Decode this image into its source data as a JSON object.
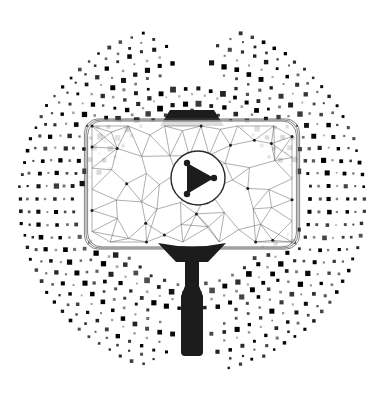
{
  "artwork": {
    "title": "Low-poly video player on selfie stick",
    "subject": "play-button-screen",
    "background_color": "#ffffff",
    "ink_color": "#222222",
    "mesh_color": "#555555",
    "dot_color": "#262626",
    "canvas": {
      "width": 384,
      "height": 398
    }
  },
  "halo": {
    "name": "dotted-rings",
    "center": {
      "x": 192,
      "y": 199
    },
    "dot_shape": "square",
    "rings": [
      {
        "radius": 172,
        "count": 88,
        "size": 3.0,
        "opacity": 0.95,
        "start_deg": 0,
        "end_deg": 360,
        "gaps": [
          [
            78,
            104
          ],
          [
            256,
            284
          ]
        ]
      },
      {
        "radius": 164,
        "count": 80,
        "size": 2.4,
        "opacity": 0.75,
        "start_deg": 0,
        "end_deg": 360,
        "gaps": [
          [
            80,
            100
          ],
          [
            258,
            282
          ]
        ]
      },
      {
        "radius": 155,
        "count": 76,
        "size": 3.6,
        "opacity": 1.0,
        "start_deg": 0,
        "end_deg": 360,
        "gaps": [
          [
            84,
            96
          ],
          [
            262,
            278
          ]
        ]
      },
      {
        "radius": 146,
        "count": 70,
        "size": 2.0,
        "opacity": 0.45,
        "start_deg": 0,
        "end_deg": 360,
        "gaps": [
          [
            82,
            98
          ],
          [
            260,
            280
          ]
        ]
      },
      {
        "radius": 137,
        "count": 66,
        "size": 4.2,
        "opacity": 1.0,
        "start_deg": 0,
        "end_deg": 360,
        "gaps": [
          [
            86,
            94
          ],
          [
            264,
            276
          ]
        ]
      },
      {
        "radius": 128,
        "count": 62,
        "size": 2.6,
        "opacity": 0.6,
        "start_deg": 0,
        "end_deg": 360,
        "gaps": [
          [
            80,
            100
          ],
          [
            258,
            282
          ]
        ]
      },
      {
        "radius": 119,
        "count": 58,
        "size": 3.4,
        "opacity": 0.9,
        "start_deg": 0,
        "end_deg": 360,
        "gaps": [
          [
            70,
            110
          ],
          [
            250,
            290
          ]
        ]
      },
      {
        "radius": 110,
        "count": 54,
        "size": 4.6,
        "opacity": 1.0,
        "start_deg": 188,
        "end_deg": 352,
        "gaps": []
      },
      {
        "radius": 104,
        "count": 50,
        "size": 2.2,
        "opacity": 0.4,
        "start_deg": 185,
        "end_deg": 355,
        "gaps": []
      },
      {
        "radius": 96,
        "count": 46,
        "size": 4.8,
        "opacity": 1.0,
        "start_deg": 196,
        "end_deg": 344,
        "gaps": []
      },
      {
        "radius": 88,
        "count": 42,
        "size": 3.0,
        "opacity": 0.7,
        "start_deg": 200,
        "end_deg": 340,
        "gaps": []
      },
      {
        "radius": 110,
        "count": 54,
        "size": 4.2,
        "opacity": 1.0,
        "start_deg": 16,
        "end_deg": 164,
        "gaps": []
      },
      {
        "radius": 102,
        "count": 48,
        "size": 2.2,
        "opacity": 0.4,
        "start_deg": 20,
        "end_deg": 160,
        "gaps": []
      },
      {
        "radius": 94,
        "count": 44,
        "size": 4.6,
        "opacity": 1.0,
        "start_deg": 28,
        "end_deg": 152,
        "gaps": []
      },
      {
        "radius": 86,
        "count": 40,
        "size": 3.0,
        "opacity": 0.7,
        "start_deg": 34,
        "end_deg": 146,
        "gaps": []
      }
    ]
  },
  "screen": {
    "name": "low-poly-screen",
    "x": 86,
    "y": 120,
    "width": 212,
    "height": 128,
    "corner_radius": 14,
    "stroke": "#4a4a4a",
    "fill": "#ffffff",
    "node_count": 46,
    "outline_layers": 3
  },
  "play_button": {
    "name": "play-button",
    "center": {
      "x": 198,
      "y": 178
    },
    "circle_radius": 27,
    "triangle": [
      {
        "x": 187,
        "y": 163
      },
      {
        "x": 214,
        "y": 178
      },
      {
        "x": 187,
        "y": 194
      }
    ],
    "vertex_dot_radius": 3.2,
    "fill": "#1c1c1c",
    "circle_stroke": "#2a2a2a",
    "label": "Play"
  },
  "mount_top": {
    "name": "top-mount-bracket",
    "cx": 192,
    "top_y": 110,
    "bottom_y": 126,
    "top_half_width": 22,
    "bottom_half_width": 32,
    "fill": "#1c1c1c"
  },
  "mount_bottom": {
    "name": "bottom-mount-bracket",
    "cx": 192,
    "top_y": 243,
    "bottom_y": 262,
    "top_half_width": 34,
    "bottom_half_width": 16,
    "fill": "#1c1c1c"
  },
  "handle": {
    "name": "selfie-stick-handle",
    "cx": 192,
    "neck": {
      "top_y": 258,
      "bottom_y": 288,
      "half_width": 7
    },
    "grip": {
      "top_y": 288,
      "bottom_y": 356,
      "half_width": 11,
      "corner_radius": 4
    },
    "fill": "#1c1c1c"
  },
  "accessibility": {
    "alt_text": "Low-poly wireframe video screen with a play button, mounted on a selfie stick, surrounded by concentric rings of square dots."
  }
}
